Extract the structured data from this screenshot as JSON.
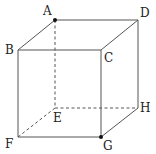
{
  "diagram": {
    "type": "cube",
    "vertices": {
      "A": {
        "label": "A",
        "x": 55,
        "y": 20,
        "dot": true
      },
      "D": {
        "label": "D",
        "x": 138,
        "y": 20,
        "dot": false
      },
      "B": {
        "label": "B",
        "x": 18,
        "y": 50,
        "dot": false
      },
      "C": {
        "label": "C",
        "x": 101,
        "y": 50,
        "dot": false
      },
      "E": {
        "label": "E",
        "x": 55,
        "y": 108,
        "dot": false
      },
      "H": {
        "label": "H",
        "x": 138,
        "y": 108,
        "dot": false
      },
      "F": {
        "label": "F",
        "x": 18,
        "y": 137,
        "dot": false
      },
      "G": {
        "label": "G",
        "x": 101,
        "y": 137,
        "dot": true
      }
    },
    "solid_edges": [
      "AD",
      "AB",
      "DC",
      "BC",
      "DH",
      "BF",
      "CG",
      "FG",
      "GH"
    ],
    "hidden_edges": [
      "AE",
      "EF",
      "EH"
    ],
    "colors": {
      "line": "#555555",
      "dot": "#111111",
      "text": "#222222"
    }
  }
}
